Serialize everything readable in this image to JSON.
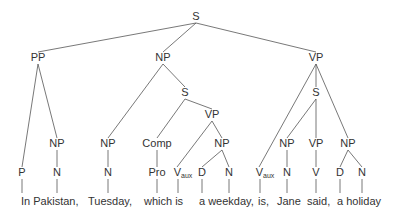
{
  "diagram": {
    "type": "syntax-tree",
    "sentence": "In Pakistan, Tuesday, which is a weekday, is, Jane said, a holiday",
    "nodes": [
      {
        "id": "S0",
        "label": "S",
        "x": 196,
        "y": 20
      },
      {
        "id": "PP",
        "label": "PP",
        "x": 38,
        "y": 61
      },
      {
        "id": "NP1",
        "label": "NP",
        "x": 163,
        "y": 61
      },
      {
        "id": "VP0",
        "label": "VP",
        "x": 316,
        "y": 61
      },
      {
        "id": "S1",
        "label": "S",
        "x": 185,
        "y": 96
      },
      {
        "id": "VP1",
        "label": "VP",
        "x": 212,
        "y": 118
      },
      {
        "id": "S2",
        "label": "S",
        "x": 316,
        "y": 96
      },
      {
        "id": "NPa",
        "label": "NP",
        "x": 57,
        "y": 147
      },
      {
        "id": "NPb",
        "label": "NP",
        "x": 108,
        "y": 147
      },
      {
        "id": "Comp",
        "label": "Comp",
        "x": 157,
        "y": 147
      },
      {
        "id": "NPc",
        "label": "NP",
        "x": 222,
        "y": 147
      },
      {
        "id": "NPd",
        "label": "NP",
        "x": 287,
        "y": 147
      },
      {
        "id": "VPd",
        "label": "VP",
        "x": 316,
        "y": 147
      },
      {
        "id": "NPe",
        "label": "NP",
        "x": 348,
        "y": 147
      },
      {
        "id": "P",
        "label": "P",
        "x": 22,
        "y": 176
      },
      {
        "id": "Na",
        "label": "N",
        "x": 57,
        "y": 176
      },
      {
        "id": "Nb",
        "label": "N",
        "x": 108,
        "y": 176
      },
      {
        "id": "Pro",
        "label": "Pro",
        "x": 157,
        "y": 176
      },
      {
        "id": "Vaux1",
        "label": "V",
        "sub": "aux",
        "x": 180,
        "y": 176
      },
      {
        "id": "Dc",
        "label": "D",
        "x": 202,
        "y": 176
      },
      {
        "id": "Nc",
        "label": "N",
        "x": 229,
        "y": 176
      },
      {
        "id": "Vaux2",
        "label": "V",
        "sub": "aux",
        "x": 262,
        "y": 176
      },
      {
        "id": "Nd",
        "label": "N",
        "x": 287,
        "y": 176
      },
      {
        "id": "V",
        "label": "V",
        "x": 316,
        "y": 176
      },
      {
        "id": "De",
        "label": "D",
        "x": 340,
        "y": 176
      },
      {
        "id": "Ne",
        "label": "N",
        "x": 362,
        "y": 176
      }
    ],
    "edges": [
      [
        "S0",
        "PP"
      ],
      [
        "S0",
        "NP1"
      ],
      [
        "S0",
        "VP0"
      ],
      [
        "PP",
        "P"
      ],
      [
        "PP",
        "NPa"
      ],
      [
        "NPa",
        "Na"
      ],
      [
        "NP1",
        "NPb"
      ],
      [
        "NP1",
        "S1"
      ],
      [
        "NPb",
        "Nb"
      ],
      [
        "S1",
        "Comp"
      ],
      [
        "S1",
        "VP1"
      ],
      [
        "Comp",
        "Pro"
      ],
      [
        "VP1",
        "Vaux1"
      ],
      [
        "VP1",
        "NPc"
      ],
      [
        "NPc",
        "Dc"
      ],
      [
        "NPc",
        "Nc"
      ],
      [
        "VP0",
        "Vaux2"
      ],
      [
        "VP0",
        "S2"
      ],
      [
        "VP0",
        "NPe"
      ],
      [
        "S2",
        "NPd"
      ],
      [
        "S2",
        "VPd"
      ],
      [
        "NPd",
        "Nd"
      ],
      [
        "VPd",
        "V"
      ],
      [
        "NPe",
        "De"
      ],
      [
        "NPe",
        "Ne"
      ]
    ],
    "words": [
      {
        "text": "In Pakistan,",
        "x": 21,
        "y": 205
      },
      {
        "text": "Tuesday,",
        "x": 88,
        "y": 205
      },
      {
        "text": "which is",
        "x": 144,
        "y": 205
      },
      {
        "text": "a weekday,",
        "x": 199,
        "y": 205
      },
      {
        "text": "is,",
        "x": 258,
        "y": 205
      },
      {
        "text": "Jane",
        "x": 277,
        "y": 205
      },
      {
        "text": "said,",
        "x": 307,
        "y": 205
      },
      {
        "text": "a holiday",
        "x": 337,
        "y": 205
      }
    ],
    "word_links": [
      {
        "from": "P",
        "x": 22
      },
      {
        "from": "Na",
        "x": 57
      },
      {
        "from": "Nb",
        "x": 108
      },
      {
        "from": "Pro",
        "x": 157
      },
      {
        "from": "Vaux1",
        "x": 178
      },
      {
        "from": "Dc",
        "x": 202
      },
      {
        "from": "Nc",
        "x": 229
      },
      {
        "from": "Vaux2",
        "x": 260
      },
      {
        "from": "Nd",
        "x": 287
      },
      {
        "from": "V",
        "x": 316
      },
      {
        "from": "De",
        "x": 340
      },
      {
        "from": "Ne",
        "x": 362
      }
    ]
  }
}
